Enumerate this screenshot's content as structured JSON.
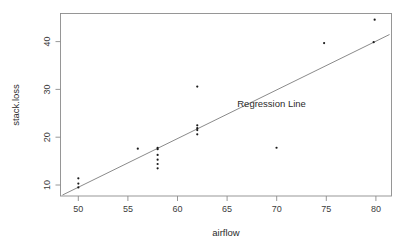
{
  "chart_data": {
    "type": "scatter",
    "title": "",
    "xlabel": "airflow",
    "ylabel": "stack.loss",
    "xlim": [
      48.2,
      81.6
    ],
    "ylim": [
      5.4,
      43.6
    ],
    "grid": false,
    "legend_position": "none",
    "x_ticks": [
      50,
      55,
      60,
      65,
      70,
      75,
      80
    ],
    "x_tick_labels": [
      "50",
      "55",
      "60",
      "65",
      "70",
      "75",
      "80"
    ],
    "y_ticks": [
      10,
      20,
      30,
      40
    ],
    "y_tick_labels": [
      "10",
      "20",
      "30",
      "40"
    ],
    "series": [
      {
        "name": "stack.loss observations",
        "marker": "point",
        "color": "#1a1a1a",
        "points": [
          {
            "x": 50,
            "y": 7.2
          },
          {
            "x": 50,
            "y": 8.0
          },
          {
            "x": 50,
            "y": 9.1
          },
          {
            "x": 56,
            "y": 15.3
          },
          {
            "x": 58,
            "y": 11.2
          },
          {
            "x": 58,
            "y": 12.1
          },
          {
            "x": 58,
            "y": 13.0
          },
          {
            "x": 58,
            "y": 14.0
          },
          {
            "x": 58,
            "y": 15.2
          },
          {
            "x": 58,
            "y": 15.5
          },
          {
            "x": 62,
            "y": 18.3
          },
          {
            "x": 62,
            "y": 19.2
          },
          {
            "x": 62,
            "y": 19.6
          },
          {
            "x": 62,
            "y": 20.2
          },
          {
            "x": 62,
            "y": 28.3
          },
          {
            "x": 70,
            "y": 15.5
          },
          {
            "x": 74.8,
            "y": 37.4
          },
          {
            "x": 79.8,
            "y": 37.6
          },
          {
            "x": 79.9,
            "y": 42.3
          }
        ]
      }
    ],
    "regression_line": {
      "label": "Regression Line",
      "color": "#7d7d7d",
      "x_start": 48.4,
      "y_start": 5.6,
      "x_end": 81.4,
      "y_end": 39.2,
      "label_x": 69.5,
      "label_y": 24.0
    }
  }
}
